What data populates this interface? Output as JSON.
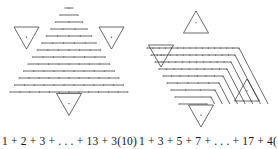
{
  "figure": {
    "type": "proof-without-words-diagram",
    "background_color": "#ffffff",
    "ink_color": "#2b2b2b",
    "panels": [
      {
        "id": "left",
        "name": "triangular-number-hexagram",
        "caption": "1 + 2 + 3 + . . . + 13 + 3(10)",
        "caption_terms": [
          "1",
          "2",
          "3",
          ". . .",
          "13",
          "3(10)"
        ],
        "central_figure": "downward-triangle-of-dot-rows",
        "row_count": 13,
        "row_dot_counts": [
          1,
          2,
          3,
          4,
          5,
          6,
          7,
          8,
          9,
          10,
          11,
          12,
          13
        ],
        "corner_triangles": [
          {
            "position": "top",
            "orientation": "up",
            "dots": 1
          },
          {
            "position": "left",
            "orientation": "down",
            "dots": 1
          },
          {
            "position": "right",
            "orientation": "down",
            "dots": 1
          },
          {
            "position": "bottom",
            "orientation": "down",
            "dots": 1
          }
        ],
        "corner_triangle_count": 3,
        "corner_triangle_size": 10
      },
      {
        "id": "right",
        "name": "odd-number-gnomon-hexagram",
        "caption": "1 + 3 + 5 + 7 + . . . + 17 + 4(10)",
        "caption_terms": [
          "1",
          "3",
          "5",
          "7",
          ". . .",
          "17",
          "4(10)"
        ],
        "central_figure": "nested-gnomon-chevrons",
        "gnomon_count": 9,
        "gnomon_dot_counts": [
          1,
          3,
          5,
          7,
          9,
          11,
          13,
          15,
          17
        ],
        "corner_triangles": [
          {
            "position": "top",
            "orientation": "up",
            "dots": 1
          },
          {
            "position": "left",
            "orientation": "down",
            "dots": 1
          },
          {
            "position": "right",
            "orientation": "up",
            "dots": 1
          },
          {
            "position": "bottom",
            "orientation": "down",
            "dots": 1
          }
        ],
        "corner_triangle_count": 4,
        "corner_triangle_size": 10
      }
    ]
  },
  "chart_data": {
    "type": "diagram",
    "title": "",
    "series": [
      {
        "name": "1 + 2 + 3 + . . . + 13 + 3(10)",
        "values": [
          1,
          2,
          3,
          4,
          5,
          6,
          7,
          8,
          9,
          10,
          11,
          12,
          13
        ],
        "extra": "3(10)"
      },
      {
        "name": "1 + 3 + 5 + 7 + . . . + 17 + 4(10)",
        "values": [
          1,
          3,
          5,
          7,
          9,
          11,
          13,
          15,
          17
        ],
        "extra": "4(10)"
      }
    ]
  }
}
